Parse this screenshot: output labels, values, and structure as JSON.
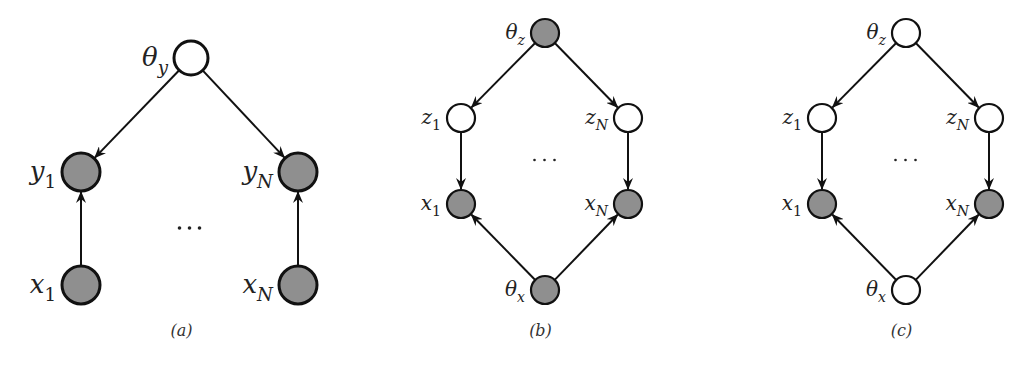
{
  "figure": {
    "panels": [
      {
        "id": "a",
        "caption": "(a)",
        "ellipsis": "···",
        "nodes": [
          {
            "id": "theta_y",
            "label": "θ",
            "subscript": "y",
            "observed": false,
            "cx": 191,
            "cy": 58,
            "r": 17
          },
          {
            "id": "y_1",
            "label": "y",
            "subscript": "1",
            "observed": true,
            "cx": 81,
            "cy": 172,
            "r": 19
          },
          {
            "id": "y_N",
            "label": "y",
            "subscript": "N",
            "observed": true,
            "cx": 298,
            "cy": 172,
            "r": 19
          },
          {
            "id": "x_1",
            "label": "x",
            "subscript": "1",
            "observed": true,
            "cx": 81,
            "cy": 285,
            "r": 19
          },
          {
            "id": "x_N",
            "label": "x",
            "subscript": "N",
            "observed": true,
            "cx": 298,
            "cy": 285,
            "r": 19
          }
        ],
        "edges": [
          {
            "from": "theta_y",
            "to": "y_1"
          },
          {
            "from": "theta_y",
            "to": "y_N"
          },
          {
            "from": "x_1",
            "to": "y_1"
          },
          {
            "from": "x_N",
            "to": "y_N"
          }
        ]
      },
      {
        "id": "b",
        "caption": "(b)",
        "ellipsis": "···",
        "nodes": [
          {
            "id": "theta_z",
            "label": "θ",
            "subscript": "z",
            "observed": true,
            "cx": 545,
            "cy": 33,
            "r": 14
          },
          {
            "id": "z_1",
            "label": "z",
            "subscript": "1",
            "observed": false,
            "cx": 461,
            "cy": 118,
            "r": 14
          },
          {
            "id": "z_N",
            "label": "z",
            "subscript": "N",
            "observed": false,
            "cx": 628,
            "cy": 118,
            "r": 14
          },
          {
            "id": "x_1",
            "label": "x",
            "subscript": "1",
            "observed": true,
            "cx": 461,
            "cy": 204,
            "r": 14
          },
          {
            "id": "x_N",
            "label": "x",
            "subscript": "N",
            "observed": true,
            "cx": 628,
            "cy": 204,
            "r": 14
          },
          {
            "id": "theta_x",
            "label": "θ",
            "subscript": "x",
            "observed": true,
            "cx": 545,
            "cy": 290,
            "r": 14
          }
        ],
        "edges": [
          {
            "from": "theta_z",
            "to": "z_1"
          },
          {
            "from": "theta_z",
            "to": "z_N"
          },
          {
            "from": "z_1",
            "to": "x_1"
          },
          {
            "from": "z_N",
            "to": "x_N"
          },
          {
            "from": "theta_x",
            "to": "x_1"
          },
          {
            "from": "theta_x",
            "to": "x_N"
          }
        ]
      },
      {
        "id": "c",
        "caption": "(c)",
        "ellipsis": "···",
        "nodes": [
          {
            "id": "theta_z",
            "label": "θ",
            "subscript": "z",
            "observed": false,
            "cx": 906,
            "cy": 33,
            "r": 14
          },
          {
            "id": "z_1",
            "label": "z",
            "subscript": "1",
            "observed": false,
            "cx": 822,
            "cy": 118,
            "r": 14
          },
          {
            "id": "z_N",
            "label": "z",
            "subscript": "N",
            "observed": false,
            "cx": 989,
            "cy": 118,
            "r": 14
          },
          {
            "id": "x_1",
            "label": "x",
            "subscript": "1",
            "observed": true,
            "cx": 822,
            "cy": 204,
            "r": 14
          },
          {
            "id": "x_N",
            "label": "x",
            "subscript": "N",
            "observed": true,
            "cx": 989,
            "cy": 204,
            "r": 14
          },
          {
            "id": "theta_x",
            "label": "θ",
            "subscript": "x",
            "observed": false,
            "cx": 906,
            "cy": 290,
            "r": 14
          }
        ],
        "edges": [
          {
            "from": "theta_z",
            "to": "z_1"
          },
          {
            "from": "theta_z",
            "to": "z_N"
          },
          {
            "from": "z_1",
            "to": "x_1"
          },
          {
            "from": "z_N",
            "to": "x_N"
          },
          {
            "from": "theta_x",
            "to": "x_1"
          },
          {
            "from": "theta_x",
            "to": "x_N"
          }
        ]
      }
    ]
  },
  "colors": {
    "observed_fill": "#8f8f8f",
    "latent_fill": "#ffffff",
    "stroke": "#111111"
  }
}
